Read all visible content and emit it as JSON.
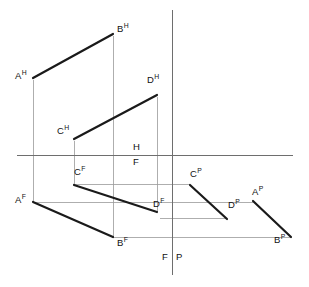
{
  "diagram": {
    "type": "descriptive-geometry-three-view-projection",
    "canvas": {
      "width": 309,
      "height": 287,
      "background": "#ffffff"
    },
    "colors": {
      "heavy_line": "#1a1a1a",
      "thin_line": "#9a9a9a",
      "axis_line": "#6e6e6e",
      "text": "#111111"
    },
    "axes": {
      "ground_line": {
        "x1": 17,
        "y1": 155,
        "x2": 293,
        "y2": 155,
        "label_above": "H",
        "label_below": "F"
      },
      "profile_line": {
        "x1": 172,
        "y1": 10,
        "x2": 172,
        "y2": 275,
        "label_left": "F",
        "label_right": "P"
      }
    },
    "quadrant_labels": [
      {
        "name": "H",
        "text": "H",
        "x": 133,
        "y": 142
      },
      {
        "name": "F",
        "text": "F",
        "x": 133,
        "y": 157
      },
      {
        "name": "F-bottom",
        "text": "F",
        "x": 162,
        "y": 252
      },
      {
        "name": "P-bottom",
        "text": "P",
        "x": 176,
        "y": 252
      }
    ],
    "points": [
      {
        "id": "AH",
        "letter": "A",
        "view": "H",
        "text": "A",
        "sup": "H",
        "x": 33,
        "y": 78,
        "label_x": 15,
        "label_y": 70
      },
      {
        "id": "BH",
        "letter": "B",
        "view": "H",
        "text": "B",
        "sup": "H",
        "x": 113,
        "y": 34,
        "label_x": 117,
        "label_y": 23
      },
      {
        "id": "CH",
        "letter": "C",
        "view": "H",
        "text": "C",
        "sup": "H",
        "x": 74,
        "y": 139,
        "label_x": 57,
        "label_y": 125
      },
      {
        "id": "DH",
        "letter": "D",
        "view": "H",
        "text": "D",
        "sup": "H",
        "x": 157,
        "y": 95,
        "label_x": 147,
        "label_y": 74
      },
      {
        "id": "AF",
        "letter": "A",
        "view": "F",
        "text": "A",
        "sup": "F",
        "x": 33,
        "y": 202,
        "label_x": 15,
        "label_y": 194
      },
      {
        "id": "BF",
        "letter": "B",
        "view": "F",
        "text": "B",
        "sup": "F",
        "x": 113,
        "y": 237,
        "label_x": 117,
        "label_y": 237
      },
      {
        "id": "CF",
        "letter": "C",
        "view": "F",
        "text": "C",
        "sup": "F",
        "x": 74,
        "y": 185,
        "label_x": 74,
        "label_y": 166
      },
      {
        "id": "DF",
        "letter": "D",
        "view": "F",
        "text": "D",
        "sup": "F",
        "x": 157,
        "y": 212,
        "label_x": 153,
        "label_y": 198
      },
      {
        "id": "CP",
        "letter": "C",
        "view": "P",
        "text": "C",
        "sup": "P",
        "x": 190,
        "y": 185,
        "label_x": 190,
        "label_y": 168
      },
      {
        "id": "DP",
        "letter": "D",
        "view": "P",
        "text": "D",
        "sup": "P",
        "x": 227,
        "y": 219,
        "label_x": 228,
        "label_y": 199
      },
      {
        "id": "AP",
        "letter": "A",
        "view": "P",
        "text": "A",
        "sup": "P",
        "x": 253,
        "y": 201,
        "label_x": 252,
        "label_y": 186
      },
      {
        "id": "BP",
        "letter": "B",
        "view": "P",
        "text": "B",
        "sup": "P",
        "x": 291,
        "y": 237,
        "label_x": 274,
        "label_y": 234
      }
    ],
    "heavy_segments": [
      {
        "name": "segment-AH-BH",
        "from": "AH",
        "to": "BH",
        "x1": 33,
        "y1": 78,
        "x2": 113,
        "y2": 34
      },
      {
        "name": "segment-CH-DH",
        "from": "CH",
        "to": "DH",
        "x1": 74,
        "y1": 139,
        "x2": 157,
        "y2": 95
      },
      {
        "name": "segment-AF-BF",
        "from": "AF",
        "to": "BF",
        "x1": 33,
        "y1": 202,
        "x2": 113,
        "y2": 237
      },
      {
        "name": "segment-CF-DF",
        "from": "CF",
        "to": "DF",
        "x1": 74,
        "y1": 185,
        "x2": 157,
        "y2": 212
      },
      {
        "name": "segment-CP-DP",
        "from": "CP",
        "to": "DP",
        "x1": 190,
        "y1": 185,
        "x2": 227,
        "y2": 219
      },
      {
        "name": "segment-AP-BP",
        "from": "AP",
        "to": "BP",
        "x1": 253,
        "y1": 201,
        "x2": 291,
        "y2": 237
      }
    ],
    "projector_verticals": [
      {
        "name": "projector-A-vertical",
        "x": 33,
        "y1": 80,
        "y2": 202
      },
      {
        "name": "projector-B-vertical",
        "x": 113,
        "y1": 36,
        "y2": 237
      },
      {
        "name": "projector-C-vertical",
        "x": 74,
        "y1": 141,
        "y2": 185
      },
      {
        "name": "projector-D-vertical",
        "x": 157,
        "y1": 97,
        "y2": 212
      }
    ],
    "projector_horizontals": [
      {
        "name": "projector-C-horizontal",
        "y": 184,
        "x1": 74,
        "x2": 190
      },
      {
        "name": "projector-A-horizontal",
        "y": 202,
        "x1": 33,
        "x2": 253
      },
      {
        "name": "projector-D-horizontal",
        "y": 218,
        "x1": 160,
        "x2": 227
      },
      {
        "name": "projector-B-horizontal",
        "y": 237,
        "x1": 113,
        "x2": 291
      }
    ]
  }
}
